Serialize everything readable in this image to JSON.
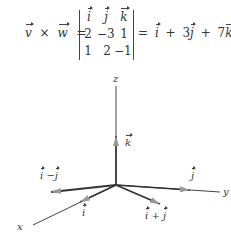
{
  "equation": {
    "lhs": {
      "v": "v",
      "times": "×",
      "w": "w",
      "equals": "="
    },
    "matrix": {
      "rows": [
        [
          "i",
          "j",
          "k"
        ],
        [
          "2",
          "−3",
          "1"
        ],
        [
          "1",
          "2",
          "−1"
        ]
      ]
    },
    "rhs": {
      "equals": "=",
      "t1": "i",
      "plus1": "+",
      "c2": "3",
      "t2": "j",
      "plus2": "+",
      "c3": "7",
      "t3": "k"
    }
  },
  "diagram": {
    "axes": {
      "x": "x",
      "y": "y",
      "z": "z"
    },
    "vectors": {
      "i": "i",
      "j": "j",
      "k": "k",
      "i_minus_j": {
        "a": "i",
        "op": "−",
        "b": "j"
      },
      "i_plus_j": {
        "a": "i",
        "op": "+",
        "b": "j"
      }
    },
    "colors": {
      "axis": "#333333",
      "arrow": "#888888"
    }
  }
}
